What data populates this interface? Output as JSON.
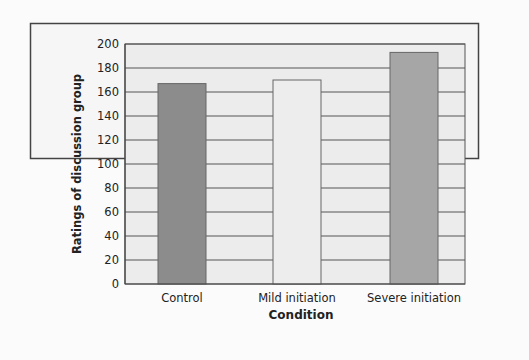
{
  "chart_data": {
    "type": "bar",
    "title": "",
    "xlabel": "Condition",
    "ylabel": "Ratings of discussion group",
    "ylim": [
      0,
      200
    ],
    "yticks": [
      0,
      20,
      40,
      60,
      80,
      100,
      120,
      140,
      160,
      180,
      200
    ],
    "categories": [
      "Control",
      "Mild initiation",
      "Severe initiation"
    ],
    "values": [
      167,
      170,
      193
    ],
    "bar_colors": [
      "#8c8c8c",
      "#ededed",
      "#a6a6a6"
    ],
    "grid": true,
    "legend": null
  },
  "colors": {
    "frame_bg": "#f6f6f6",
    "plot_bg": "#ececec",
    "grid": "#555555",
    "border": "#444444"
  }
}
